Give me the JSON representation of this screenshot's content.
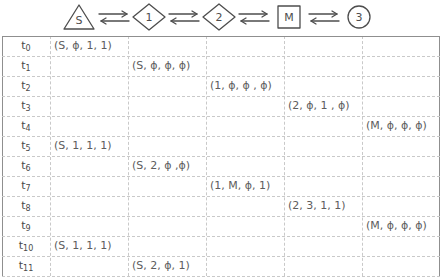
{
  "diagram": {
    "chain": {
      "nodes": [
        {
          "shape": "triangle",
          "label": "S",
          "name": "node-source-s"
        },
        {
          "shape": "diamond",
          "label": "1",
          "name": "node-diamond-1"
        },
        {
          "shape": "diamond",
          "label": "2",
          "name": "node-diamond-2"
        },
        {
          "shape": "square",
          "label": "M",
          "name": "node-square-m"
        },
        {
          "shape": "circle",
          "label": "3",
          "name": "node-circle-3"
        }
      ],
      "connector": "bidirectional-double-arrow",
      "connector_count": 4
    },
    "table": {
      "time_column_header": "",
      "column_count": 6,
      "rows": [
        {
          "time": "t",
          "sub": "0",
          "col": 1,
          "value": "(S, ϕ, 1, 1)"
        },
        {
          "time": "t",
          "sub": "1",
          "col": 2,
          "value": "(S, ϕ, ϕ, ϕ)"
        },
        {
          "time": "t",
          "sub": "2",
          "col": 3,
          "value": "(1, ϕ, ϕ , ϕ)"
        },
        {
          "time": "t",
          "sub": "3",
          "col": 4,
          "value": "(2, ϕ, 1 , ϕ)"
        },
        {
          "time": "t",
          "sub": "4",
          "col": 5,
          "value": "(M, ϕ, ϕ, ϕ)"
        },
        {
          "time": "t",
          "sub": "5",
          "col": 1,
          "value": "(S, 1, 1, 1)"
        },
        {
          "time": "t",
          "sub": "6",
          "col": 2,
          "value": "(S, 2, ϕ ,ϕ)"
        },
        {
          "time": "t",
          "sub": "7",
          "col": 3,
          "value": "(1, M, ϕ, 1)"
        },
        {
          "time": "t",
          "sub": "8",
          "col": 4,
          "value": "(2, 3, 1, 1)"
        },
        {
          "time": "t",
          "sub": "9",
          "col": 5,
          "value": "(M, ϕ, ϕ, ϕ)"
        },
        {
          "time": "t",
          "sub": "10",
          "col": 1,
          "value": "(S, 1, 1, 1)"
        },
        {
          "time": "t",
          "sub": "11",
          "col": 2,
          "value": "(S, 2, ϕ, 1)"
        }
      ]
    },
    "colors": {
      "stroke": "#4d4d4d",
      "grid_line": "#c9c9c9",
      "border": "#8f8f8f",
      "text": "#5a5a5a",
      "background": "#ffffff"
    }
  }
}
